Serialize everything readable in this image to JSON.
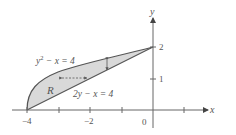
{
  "diagram": {
    "axes": {
      "x_label": "x",
      "y_label": "y",
      "x_ticks": [
        {
          "value": -4,
          "label": "−4"
        },
        {
          "value": -3,
          "label": ""
        },
        {
          "value": -2,
          "label": "−2"
        },
        {
          "value": -1,
          "label": ""
        },
        {
          "value": 0,
          "label": "0"
        },
        {
          "value": 1,
          "label": ""
        }
      ],
      "y_ticks": [
        {
          "value": 1,
          "label": "1"
        },
        {
          "value": 2,
          "label": "2"
        }
      ]
    },
    "curves": {
      "upper": {
        "equation_base": "y",
        "equation_exp": "2",
        "equation_rest": " − x = 4"
      },
      "lower": {
        "equation": "2y − x = 4"
      }
    },
    "region_label": "R",
    "colors": {
      "fill": "#d9d9d9",
      "curve": "#555555",
      "axis": "#666666",
      "text": "#555555"
    }
  }
}
